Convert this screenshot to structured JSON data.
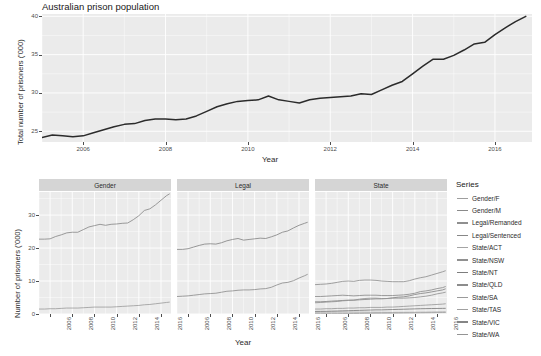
{
  "figure": {
    "title": "Australian prison population",
    "background": "#ffffff",
    "panel_background": "#ebebeb",
    "gridline_color": "#ffffff",
    "strip_background": "#d5d5d5"
  },
  "top_chart": {
    "ylabel": "Total number of prisoners ('000)",
    "xlabel": "Year",
    "y_ticks": [
      "25",
      "30",
      "35",
      "40"
    ],
    "x_ticks": [
      "2006",
      "2008",
      "2010",
      "2012",
      "2014",
      "2016"
    ],
    "line_color": "#2b2b2b"
  },
  "facets": {
    "ylabel": "Number of prisoners ('000)",
    "xlabel": "Year",
    "y_ticks": [
      "0",
      "10",
      "20",
      "30"
    ],
    "x_ticks": [
      "2006",
      "2008",
      "2010",
      "2012",
      "2014",
      "2016"
    ],
    "strips": [
      "Gender",
      "Legal",
      "State"
    ]
  },
  "legend": {
    "title": "Series",
    "items": [
      {
        "label": "Gender/F",
        "color": "#9e9e9e"
      },
      {
        "label": "Gender/M",
        "color": "#8a8a8a"
      },
      {
        "label": "Legal/Remanded",
        "color": "#8f8f8f"
      },
      {
        "label": "Legal/Sentenced",
        "color": "#878787"
      },
      {
        "label": "State/ACT",
        "color": "#a4a4a4"
      },
      {
        "label": "State/NSW",
        "color": "#909090"
      },
      {
        "label": "State/NT",
        "color": "#7d7d7d"
      },
      {
        "label": "State/QLD",
        "color": "#8c8c8c"
      },
      {
        "label": "State/SA",
        "color": "#9a9a9a"
      },
      {
        "label": "State/TAS",
        "color": "#a0a0a0"
      },
      {
        "label": "State/VIC",
        "color": "#858585"
      },
      {
        "label": "State/WA",
        "color": "#949494"
      }
    ]
  },
  "chart_data": [
    {
      "type": "line",
      "id": "total",
      "title": "Australian prison population",
      "xlabel": "Year",
      "ylabel": "Total number of prisoners ('000)",
      "xlim": [
        2005.0,
        2016.9
      ],
      "ylim": [
        23.6,
        40.3
      ],
      "x_ticks": [
        2006,
        2008,
        2010,
        2012,
        2014,
        2016
      ],
      "y_ticks": [
        25,
        30,
        35,
        40
      ],
      "grid": true,
      "legend_position": "none",
      "series": [
        {
          "name": "Total",
          "x": [
            2005.0,
            2005.25,
            2005.5,
            2005.75,
            2006.0,
            2006.25,
            2006.5,
            2006.75,
            2007.0,
            2007.25,
            2007.5,
            2007.75,
            2008.0,
            2008.25,
            2008.5,
            2008.75,
            2009.0,
            2009.25,
            2009.5,
            2009.75,
            2010.0,
            2010.25,
            2010.5,
            2010.75,
            2011.0,
            2011.25,
            2011.5,
            2011.75,
            2012.0,
            2012.25,
            2012.5,
            2012.75,
            2013.0,
            2013.25,
            2013.5,
            2013.75,
            2014.0,
            2014.25,
            2014.5,
            2014.75,
            2015.0,
            2015.25,
            2015.5,
            2015.75,
            2016.0,
            2016.25,
            2016.5,
            2016.75
          ],
          "y": [
            24.2,
            24.5,
            24.4,
            24.3,
            24.4,
            24.8,
            25.2,
            25.6,
            25.9,
            26.0,
            26.4,
            26.6,
            26.6,
            26.5,
            26.6,
            27.0,
            27.6,
            28.2,
            28.6,
            28.9,
            29.0,
            29.1,
            29.6,
            29.1,
            28.9,
            28.7,
            29.1,
            29.3,
            29.4,
            29.5,
            29.6,
            29.9,
            29.8,
            30.4,
            31.0,
            31.5,
            32.5,
            33.5,
            34.4,
            34.4,
            34.9,
            35.6,
            36.4,
            36.6,
            37.6,
            38.5,
            39.3,
            40.0
          ]
        }
      ]
    },
    {
      "type": "line",
      "id": "gender",
      "facet": "Gender",
      "xlabel": "Year",
      "ylabel": "Number of prisoners ('000)",
      "xlim": [
        2005.0,
        2016.9
      ],
      "ylim": [
        0,
        37
      ],
      "x_ticks": [
        2006,
        2008,
        2010,
        2012,
        2014,
        2016
      ],
      "y_ticks": [
        0,
        10,
        20,
        30
      ],
      "grid": true,
      "series": [
        {
          "name": "Gender/M",
          "x": [
            2005.0,
            2005.5,
            2006.0,
            2006.5,
            2007.0,
            2007.5,
            2008.0,
            2008.5,
            2009.0,
            2009.5,
            2010.0,
            2010.5,
            2011.0,
            2011.5,
            2012.0,
            2012.5,
            2013.0,
            2013.5,
            2014.0,
            2014.5,
            2015.0,
            2015.5,
            2016.0,
            2016.5,
            2016.75
          ],
          "y": [
            22.7,
            22.7,
            22.8,
            23.5,
            24.0,
            24.6,
            24.8,
            24.8,
            25.6,
            26.4,
            26.8,
            27.2,
            26.9,
            27.2,
            27.3,
            27.5,
            27.6,
            28.6,
            29.8,
            31.4,
            31.9,
            33.1,
            34.5,
            35.9,
            36.4
          ]
        },
        {
          "name": "Gender/F",
          "x": [
            2005.0,
            2005.5,
            2006.0,
            2006.5,
            2007.0,
            2007.5,
            2008.0,
            2008.5,
            2009.0,
            2009.5,
            2010.0,
            2010.5,
            2011.0,
            2011.5,
            2012.0,
            2012.5,
            2013.0,
            2013.5,
            2014.0,
            2014.5,
            2015.0,
            2015.5,
            2016.0,
            2016.5,
            2016.75
          ],
          "y": [
            1.5,
            1.5,
            1.6,
            1.6,
            1.7,
            1.8,
            1.8,
            1.8,
            1.9,
            2.0,
            2.1,
            2.1,
            2.1,
            2.1,
            2.2,
            2.3,
            2.4,
            2.5,
            2.6,
            2.8,
            2.9,
            3.1,
            3.3,
            3.5,
            3.6
          ]
        }
      ]
    },
    {
      "type": "line",
      "id": "legal",
      "facet": "Legal",
      "xlabel": "Year",
      "ylabel": "Number of prisoners ('000)",
      "xlim": [
        2005.0,
        2016.9
      ],
      "ylim": [
        0,
        37
      ],
      "x_ticks": [
        2006,
        2008,
        2010,
        2012,
        2014,
        2016
      ],
      "y_ticks": [
        0,
        10,
        20,
        30
      ],
      "grid": true,
      "series": [
        {
          "name": "Legal/Sentenced",
          "x": [
            2005.0,
            2005.5,
            2006.0,
            2006.5,
            2007.0,
            2007.5,
            2008.0,
            2008.5,
            2009.0,
            2009.5,
            2010.0,
            2010.5,
            2011.0,
            2011.5,
            2012.0,
            2012.5,
            2013.0,
            2013.5,
            2014.0,
            2014.5,
            2015.0,
            2015.5,
            2016.0,
            2016.5,
            2016.75
          ],
          "y": [
            19.6,
            19.6,
            19.8,
            20.3,
            20.8,
            21.2,
            21.3,
            21.2,
            21.6,
            22.2,
            22.6,
            22.9,
            22.4,
            22.6,
            22.8,
            23.0,
            22.9,
            23.4,
            24.0,
            24.8,
            25.2,
            26.1,
            26.9,
            27.5,
            27.8
          ]
        },
        {
          "name": "Legal/Remanded",
          "x": [
            2005.0,
            2005.5,
            2006.0,
            2006.5,
            2007.0,
            2007.5,
            2008.0,
            2008.5,
            2009.0,
            2009.5,
            2010.0,
            2010.5,
            2011.0,
            2011.5,
            2012.0,
            2012.5,
            2013.0,
            2013.5,
            2014.0,
            2014.5,
            2015.0,
            2015.5,
            2016.0,
            2016.5,
            2016.75
          ],
          "y": [
            5.3,
            5.4,
            5.5,
            5.7,
            5.9,
            6.1,
            6.2,
            6.3,
            6.6,
            6.9,
            7.0,
            7.2,
            7.3,
            7.3,
            7.4,
            7.6,
            7.7,
            8.1,
            8.8,
            9.4,
            9.6,
            10.1,
            10.9,
            11.6,
            12.0
          ]
        }
      ]
    },
    {
      "type": "line",
      "id": "state",
      "facet": "State",
      "xlabel": "Year",
      "ylabel": "Number of prisoners ('000)",
      "xlim": [
        2005.0,
        2016.9
      ],
      "ylim": [
        0,
        37
      ],
      "x_ticks": [
        2006,
        2008,
        2010,
        2012,
        2014,
        2016
      ],
      "y_ticks": [
        0,
        10,
        20,
        30
      ],
      "grid": true,
      "series": [
        {
          "name": "State/NSW",
          "x": [
            2005.0,
            2005.5,
            2006.0,
            2006.5,
            2007.0,
            2007.5,
            2008.0,
            2008.5,
            2009.0,
            2009.5,
            2010.0,
            2010.5,
            2011.0,
            2011.5,
            2012.0,
            2012.5,
            2013.0,
            2013.5,
            2014.0,
            2014.5,
            2015.0,
            2015.5,
            2016.0,
            2016.5,
            2016.75
          ],
          "y": [
            8.9,
            9.0,
            9.1,
            9.3,
            9.6,
            9.9,
            10.0,
            9.9,
            10.2,
            10.3,
            10.3,
            10.2,
            10.0,
            9.9,
            9.8,
            9.8,
            9.8,
            10.1,
            10.6,
            11.0,
            11.3,
            11.8,
            12.3,
            12.8,
            13.1
          ]
        },
        {
          "name": "State/QLD",
          "x": [
            2005.0,
            2005.5,
            2006.0,
            2006.5,
            2007.0,
            2007.5,
            2008.0,
            2008.5,
            2009.0,
            2009.5,
            2010.0,
            2010.5,
            2011.0,
            2011.5,
            2012.0,
            2012.5,
            2013.0,
            2013.5,
            2014.0,
            2014.5,
            2015.0,
            2015.5,
            2016.0,
            2016.5,
            2016.75
          ],
          "y": [
            5.3,
            5.3,
            5.4,
            5.5,
            5.6,
            5.7,
            5.6,
            5.5,
            5.6,
            5.7,
            5.7,
            5.7,
            5.6,
            5.6,
            5.6,
            5.7,
            5.8,
            6.0,
            6.3,
            6.8,
            7.0,
            7.3,
            7.7,
            8.0,
            8.3
          ]
        },
        {
          "name": "State/VIC",
          "x": [
            2005.0,
            2005.5,
            2006.0,
            2006.5,
            2007.0,
            2007.5,
            2008.0,
            2008.5,
            2009.0,
            2009.5,
            2010.0,
            2010.5,
            2011.0,
            2011.5,
            2012.0,
            2012.5,
            2013.0,
            2013.5,
            2014.0,
            2014.5,
            2015.0,
            2015.5,
            2016.0,
            2016.5,
            2016.75
          ],
          "y": [
            3.7,
            3.7,
            3.8,
            3.9,
            4.0,
            4.1,
            4.2,
            4.2,
            4.3,
            4.4,
            4.5,
            4.6,
            4.6,
            4.7,
            4.9,
            5.1,
            5.2,
            5.5,
            5.9,
            6.2,
            6.4,
            6.7,
            7.0,
            7.3,
            7.6
          ]
        },
        {
          "name": "State/WA",
          "x": [
            2005.0,
            2005.5,
            2006.0,
            2006.5,
            2007.0,
            2007.5,
            2008.0,
            2008.5,
            2009.0,
            2009.5,
            2010.0,
            2010.5,
            2011.0,
            2011.5,
            2012.0,
            2012.5,
            2013.0,
            2013.5,
            2014.0,
            2014.5,
            2015.0,
            2015.5,
            2016.0,
            2016.5,
            2016.75
          ],
          "y": [
            3.4,
            3.5,
            3.6,
            3.7,
            3.8,
            4.0,
            4.1,
            4.2,
            4.5,
            4.7,
            4.8,
            4.8,
            4.7,
            4.7,
            4.8,
            4.8,
            4.8,
            4.9,
            5.0,
            5.2,
            5.4,
            5.7,
            6.1,
            6.4,
            6.6
          ]
        },
        {
          "name": "State/SA",
          "x": [
            2005.0,
            2005.5,
            2006.0,
            2006.5,
            2007.0,
            2007.5,
            2008.0,
            2008.5,
            2009.0,
            2009.5,
            2010.0,
            2010.5,
            2011.0,
            2011.5,
            2012.0,
            2012.5,
            2013.0,
            2013.5,
            2014.0,
            2014.5,
            2015.0,
            2015.5,
            2016.0,
            2016.5,
            2016.75
          ],
          "y": [
            1.5,
            1.5,
            1.6,
            1.6,
            1.7,
            1.7,
            1.8,
            1.8,
            1.9,
            1.9,
            2.0,
            2.0,
            2.0,
            2.1,
            2.1,
            2.2,
            2.3,
            2.4,
            2.5,
            2.6,
            2.7,
            2.8,
            2.9,
            3.0,
            3.1
          ]
        },
        {
          "name": "State/TAS",
          "x": [
            2005.0,
            2005.5,
            2006.0,
            2006.5,
            2007.0,
            2007.5,
            2008.0,
            2008.5,
            2009.0,
            2009.5,
            2010.0,
            2010.5,
            2011.0,
            2011.5,
            2012.0,
            2012.5,
            2013.0,
            2013.5,
            2014.0,
            2014.5,
            2015.0,
            2015.5,
            2016.0,
            2016.5,
            2016.75
          ],
          "y": [
            0.55,
            0.56,
            0.57,
            0.58,
            0.59,
            0.6,
            0.58,
            0.56,
            0.55,
            0.54,
            0.52,
            0.51,
            0.5,
            0.49,
            0.48,
            0.49,
            0.5,
            0.51,
            0.52,
            0.54,
            0.55,
            0.57,
            0.6,
            0.62,
            0.64
          ]
        },
        {
          "name": "State/NT",
          "x": [
            2005.0,
            2005.5,
            2006.0,
            2006.5,
            2007.0,
            2007.5,
            2008.0,
            2008.5,
            2009.0,
            2009.5,
            2010.0,
            2010.5,
            2011.0,
            2011.5,
            2012.0,
            2012.5,
            2013.0,
            2013.5,
            2014.0,
            2014.5,
            2015.0,
            2015.5,
            2016.0,
            2016.5,
            2016.75
          ],
          "y": [
            0.78,
            0.8,
            0.82,
            0.86,
            0.9,
            0.96,
            1.0,
            1.05,
            1.1,
            1.15,
            1.2,
            1.25,
            1.25,
            1.3,
            1.35,
            1.4,
            1.45,
            1.5,
            1.55,
            1.6,
            1.63,
            1.66,
            1.68,
            1.7,
            1.72
          ]
        },
        {
          "name": "State/ACT",
          "x": [
            2005.0,
            2005.5,
            2006.0,
            2006.5,
            2007.0,
            2007.5,
            2008.0,
            2008.5,
            2009.0,
            2009.5,
            2010.0,
            2010.5,
            2011.0,
            2011.5,
            2012.0,
            2012.5,
            2013.0,
            2013.5,
            2014.0,
            2014.5,
            2015.0,
            2015.5,
            2016.0,
            2016.5,
            2016.75
          ],
          "y": [
            0.1,
            0.1,
            0.11,
            0.11,
            0.12,
            0.13,
            0.14,
            0.15,
            0.17,
            0.19,
            0.21,
            0.23,
            0.24,
            0.25,
            0.26,
            0.28,
            0.3,
            0.32,
            0.34,
            0.36,
            0.38,
            0.4,
            0.42,
            0.44,
            0.45
          ]
        }
      ]
    }
  ]
}
